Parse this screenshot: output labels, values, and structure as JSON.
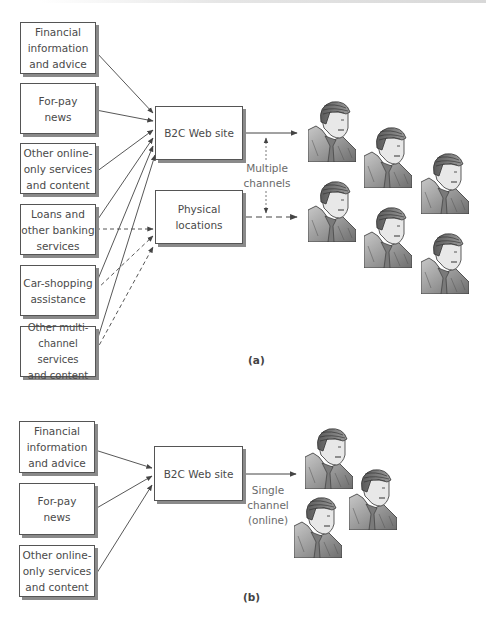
{
  "figure_a": {
    "caption": "(a)",
    "sources": [
      {
        "label": "Financial\ninformation\nand advice"
      },
      {
        "label": "For-pay\nnews"
      },
      {
        "label": "Other online-\nonly services\nand content"
      },
      {
        "label": "Loans and\nother banking\nservices"
      },
      {
        "label": "Car-shopping\nassistance"
      },
      {
        "label": "Other multi-\nchannel services\nand content"
      }
    ],
    "targets": {
      "web_site": "B2C Web site",
      "physical": "Physical\nlocations"
    },
    "channel_label": "Multiple\nchannels",
    "customer_count": 6
  },
  "figure_b": {
    "caption": "(b)",
    "sources": [
      {
        "label": "Financial\ninformation\nand advice"
      },
      {
        "label": "For-pay\nnews"
      },
      {
        "label": "Other online-\nonly services\nand content"
      }
    ],
    "targets": {
      "web_site": "B2C Web site"
    },
    "channel_label": "Single\nchannel\n(online)",
    "customer_count": 3
  },
  "colors": {
    "line": "#444444",
    "shadow": "#8a8a8a",
    "person_fill": "#9a9a9a"
  }
}
